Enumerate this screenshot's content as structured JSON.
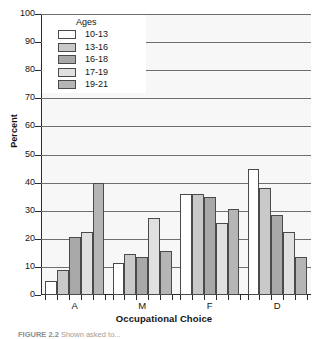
{
  "figure": {
    "caption_label": "FIGURE 2.2",
    "caption_text": "Shown asked to..."
  },
  "chart_data": {
    "type": "bar",
    "title": "",
    "xlabel": "Occupational Choice",
    "ylabel": "Percent",
    "ylim": [
      0,
      100
    ],
    "ytick_step": 10,
    "ytick_labels": [
      "0",
      "10",
      "20",
      "30",
      "40",
      "50",
      "60",
      "70",
      "80",
      "90",
      "100"
    ],
    "grid": true,
    "grid_axis": "y",
    "legend_title": "Ages",
    "legend_position": "upper-left",
    "categories": [
      "A",
      "M",
      "F",
      "D"
    ],
    "series": [
      {
        "name": "10-13",
        "color": "#ffffff",
        "values": [
          5,
          11.5,
          36,
          45
        ]
      },
      {
        "name": "13-16",
        "color": "#c9c9c9",
        "values": [
          9,
          14.5,
          36,
          38
        ]
      },
      {
        "name": "16-18",
        "color": "#a8a8a8",
        "values": [
          20.5,
          13.5,
          35,
          28.5
        ]
      },
      {
        "name": "17-19",
        "color": "#e0e0e0",
        "values": [
          22.5,
          27.5,
          25.5,
          22.5
        ]
      },
      {
        "name": "19-21",
        "color": "#b5b5b5",
        "values": [
          40,
          15.5,
          30.5,
          13.5
        ]
      }
    ]
  },
  "colors": {
    "axis": "#2b2b2b",
    "grid": "#6e6e6e",
    "plot_background": "#f7f7f7",
    "bar_outline": "#4a4a4a",
    "text": "#141414"
  }
}
